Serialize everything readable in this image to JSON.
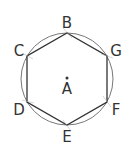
{
  "diagram": {
    "center": {
      "label": "A",
      "x": 67,
      "y": 79
    },
    "circle": {
      "r": 46,
      "stroke": "#666666"
    },
    "hexagon_stroke": "#333333",
    "vertices": [
      {
        "label": "B",
        "x": 67,
        "y": 33,
        "lx": 67,
        "ly": 23
      },
      {
        "label": "G",
        "x": 107,
        "y": 56,
        "lx": 116,
        "ly": 52
      },
      {
        "label": "F",
        "x": 107,
        "y": 102,
        "lx": 116,
        "ly": 111
      },
      {
        "label": "E",
        "x": 67,
        "y": 125,
        "lx": 67,
        "ly": 141
      },
      {
        "label": "D",
        "x": 27,
        "y": 102,
        "lx": 18,
        "ly": 111
      },
      {
        "label": "C",
        "x": 27,
        "y": 56,
        "lx": 18,
        "ly": 52
      }
    ]
  }
}
